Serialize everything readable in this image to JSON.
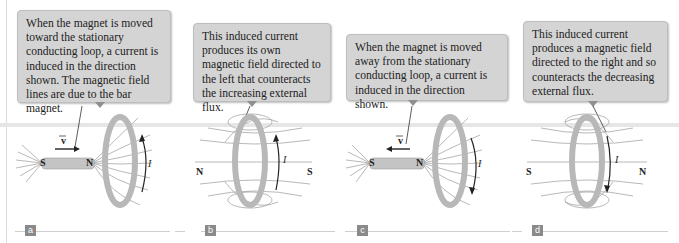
{
  "figure": {
    "panels": [
      {
        "id": "a",
        "label": "a",
        "callout": "When the magnet is moved toward the stationary conducting loop, a current is induced in the direction shown. The magnetic field lines are due to the bar magnet.",
        "velocity_label": "v",
        "velocity_direction": "right",
        "magnet_poles": {
          "left": "S",
          "right": "N"
        },
        "current_label": "I",
        "current_direction": "up"
      },
      {
        "id": "b",
        "label": "b",
        "callout": "This induced current produces its own magnetic field directed to the left that counteracts the increasing external flux.",
        "pole_left": "N",
        "pole_right": "S",
        "current_label": "I",
        "current_direction": "up",
        "field_direction": "left"
      },
      {
        "id": "c",
        "label": "c",
        "callout": "When the magnet is moved away from the stationary conducting loop, a current is induced in the direction shown.",
        "velocity_label": "v",
        "velocity_direction": "left",
        "magnet_poles": {
          "left": "S",
          "right": "N"
        },
        "current_label": "I",
        "current_direction": "down"
      },
      {
        "id": "d",
        "label": "d",
        "callout": "This induced current produces a magnetic field directed to the right and so counteracts the decreasing external flux.",
        "pole_left": "S",
        "pole_right": "N",
        "current_label": "I",
        "current_direction": "down",
        "field_direction": "right"
      }
    ],
    "colors": {
      "callout_bg": "#d4d4d4",
      "loop": "#b8b8b8",
      "magnet": "#c4c4c4",
      "field_line": "#8a8a8a",
      "label_box": "#8a8a8a"
    }
  }
}
